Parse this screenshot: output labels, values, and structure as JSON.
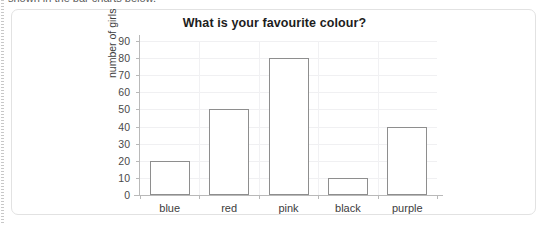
{
  "page": {
    "clipped_top_text": "shown in the bar charts below."
  },
  "chart_data": {
    "type": "bar",
    "title": "What is your favourite colour?",
    "xlabel": "",
    "ylabel": "number of girls",
    "categories": [
      "blue",
      "red",
      "pink",
      "black",
      "purple"
    ],
    "values": [
      20,
      50,
      80,
      10,
      40
    ],
    "yticks": [
      0,
      10,
      20,
      30,
      40,
      50,
      60,
      70,
      80,
      90
    ],
    "ylim": [
      0,
      90
    ],
    "grid": true,
    "legend": "none",
    "bar_style": {
      "fill": "#ffffff",
      "edge": "#8e8e8e"
    }
  },
  "colors": {
    "card_border": "#e2e2e2",
    "axis": "#b9b9b9",
    "gridline": "#f0f0f2",
    "text": "#3d3d3d",
    "title": "#1d1d1d"
  }
}
